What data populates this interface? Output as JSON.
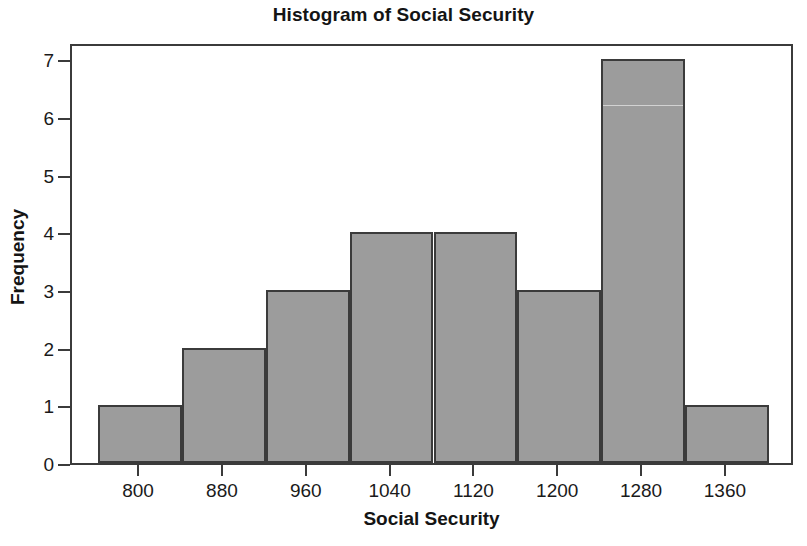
{
  "chart_data": {
    "type": "bar",
    "title": "Histogram of Social Security",
    "xlabel": "Social Security",
    "ylabel": "Frequency",
    "grid": false,
    "legend": null,
    "bin_width": 80,
    "bin_edges": [
      760,
      840,
      920,
      1000,
      1080,
      1160,
      1240,
      1320,
      1400
    ],
    "bin_centers": [
      800,
      880,
      960,
      1040,
      1120,
      1200,
      1280,
      1360
    ],
    "categories": [
      "800",
      "880",
      "960",
      "1040",
      "1120",
      "1200",
      "1280",
      "1360"
    ],
    "values": [
      1,
      2,
      3,
      4,
      4,
      3,
      7,
      1
    ],
    "x_tick_labels": [
      "800",
      "880",
      "960",
      "1040",
      "1120",
      "1200",
      "1280",
      "1360"
    ],
    "y_tick_labels": [
      "0",
      "1",
      "2",
      "3",
      "4",
      "5",
      "6",
      "7"
    ],
    "xlim": [
      735,
      1425
    ],
    "ylim": [
      0,
      7.3
    ],
    "bar_fill_color": "#9c9c9c",
    "bar_edge_color": "#3b3b3b",
    "frame_color": "#3b3b3b",
    "background_color": "#ffffff",
    "text_color": "#141414"
  }
}
